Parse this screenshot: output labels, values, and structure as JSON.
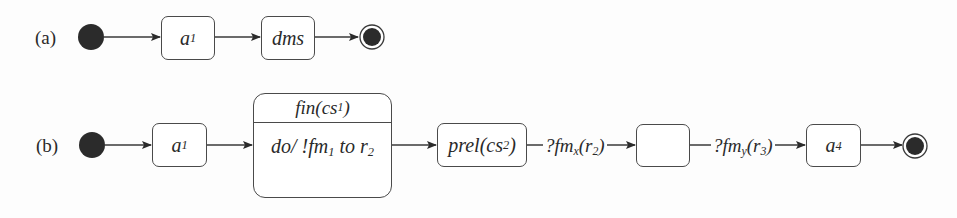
{
  "diagram": {
    "type": "uml-state-machine",
    "rows": [
      {
        "label": "(a)",
        "initial": true,
        "states": [
          {
            "id": "a1",
            "name": "a",
            "sub": "1"
          },
          {
            "id": "dms",
            "name": "dms",
            "sub": ""
          }
        ],
        "final": true
      },
      {
        "label": "(b)",
        "initial": true,
        "states": [
          {
            "id": "a1",
            "name": "a",
            "sub": "1"
          },
          {
            "id": "fin",
            "name": "fin(cs",
            "sub": "1",
            "suffix": ")",
            "activity": {
              "prefix": "do/ !fm",
              "sub1": "1",
              "mid": " to r",
              "sub2": "2"
            }
          },
          {
            "id": "prel",
            "name": "prel(cs",
            "sub": "2",
            "suffix": ")"
          },
          {
            "id": "blank",
            "name": "",
            "sub": ""
          },
          {
            "id": "a4",
            "name": "a",
            "sub": "4"
          }
        ],
        "transitions": [
          {
            "from": "prel",
            "to": "blank",
            "label": {
              "prefix": "?fm",
              "sub1": "x",
              "mid": "(r",
              "sub2": "2",
              "suffix": ")"
            }
          },
          {
            "from": "blank",
            "to": "a4",
            "label": {
              "prefix": "?fm",
              "sub1": "y",
              "mid": "(r",
              "sub2": "3",
              "suffix": ")"
            }
          }
        ],
        "final": true
      }
    ]
  },
  "labels": {
    "row_a": "(a)",
    "row_b": "(b)"
  },
  "colors": {
    "line": "#3a3a3a",
    "node_fill": "#2b2b2b",
    "background": "#fdfdfd"
  }
}
